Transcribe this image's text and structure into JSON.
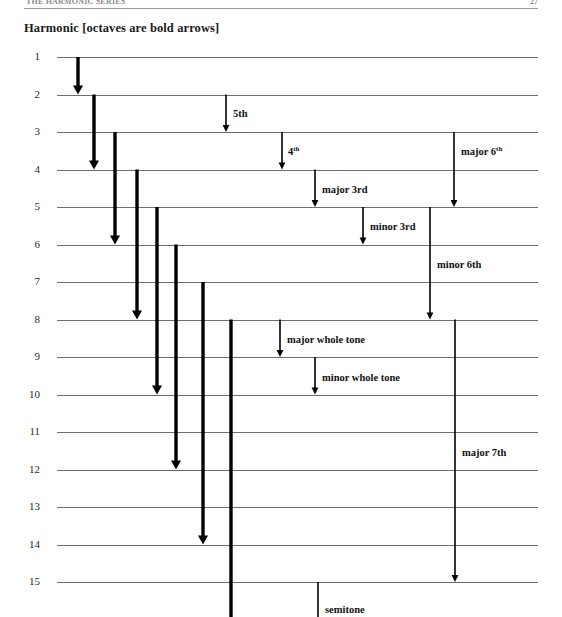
{
  "page": {
    "running_head": "THE HARMONIC SERIES",
    "folio": "27",
    "figure_title": "Harmonic  [octaves are bold arrows]"
  },
  "chart_data": {
    "type": "diagram",
    "title": "Harmonic  [octaves are bold arrows]",
    "xlabel": "",
    "ylabel": "Harmonic number",
    "grid": true,
    "legend": "octaves are bold arrows",
    "categories": [
      "1",
      "2",
      "3",
      "4",
      "5",
      "6",
      "7",
      "8",
      "9",
      "10",
      "11",
      "12",
      "13",
      "14",
      "15"
    ],
    "row_labels": [
      "1",
      "2",
      "3",
      "4",
      "5",
      "6",
      "7",
      "8",
      "9",
      "10",
      "11",
      "12",
      "13",
      "14",
      "15"
    ],
    "row_count": 15,
    "octave_arrows": [
      {
        "name": "octave-1-2",
        "from": 1,
        "to": 2,
        "x": 78,
        "bold": true
      },
      {
        "name": "octave-2-4",
        "from": 2,
        "to": 4,
        "x": 94,
        "bold": true
      },
      {
        "name": "octave-3-6",
        "from": 3,
        "to": 6,
        "x": 115,
        "bold": true
      },
      {
        "name": "octave-4-8",
        "from": 4,
        "to": 8,
        "x": 137,
        "bold": true
      },
      {
        "name": "octave-5-10",
        "from": 5,
        "to": 10,
        "x": 157,
        "bold": true
      },
      {
        "name": "octave-6-12",
        "from": 6,
        "to": 12,
        "x": 176,
        "bold": true
      },
      {
        "name": "octave-7-14",
        "from": 7,
        "to": 14,
        "x": 203,
        "bold": true
      },
      {
        "name": "octave-8-16",
        "from": 8,
        "to": 16,
        "x": 231,
        "bold": true
      }
    ],
    "interval_arrows": [
      {
        "name": "fifth",
        "label": "5th",
        "sup": "",
        "from": 2,
        "to": 3,
        "x": 226,
        "label_x": 233,
        "label_y": 108
      },
      {
        "name": "fourth",
        "label": "4",
        "sup": "th",
        "from": 3,
        "to": 4,
        "x": 282,
        "label_x": 288,
        "label_y": 146
      },
      {
        "name": "major-sixth",
        "label": "major 6",
        "sup": "th",
        "from": 3,
        "to": 5,
        "x": 454,
        "label_x": 461,
        "label_y": 146
      },
      {
        "name": "major-third",
        "label": "major 3rd",
        "sup": "",
        "from": 4,
        "to": 5,
        "x": 315,
        "label_x": 322,
        "label_y": 184
      },
      {
        "name": "minor-third",
        "label": "minor 3rd",
        "sup": "",
        "from": 5,
        "to": 6,
        "x": 363,
        "label_x": 370,
        "label_y": 221
      },
      {
        "name": "minor-sixth",
        "label": "minor 6th",
        "sup": "",
        "from": 5,
        "to": 8,
        "x": 430,
        "label_x": 437,
        "label_y": 259
      },
      {
        "name": "major-whole-tone",
        "label": "major whole tone",
        "sup": "",
        "from": 8,
        "to": 9,
        "x": 280,
        "label_x": 287,
        "label_y": 334
      },
      {
        "name": "minor-whole-tone",
        "label": "minor whole tone",
        "sup": "",
        "from": 9,
        "to": 10,
        "x": 315,
        "label_x": 322,
        "label_y": 372
      },
      {
        "name": "major-seventh",
        "label": "major 7th",
        "sup": "",
        "from": 8,
        "to": 15,
        "x": 455,
        "label_x": 462,
        "label_y": 447
      },
      {
        "name": "semitone",
        "label": "semitone",
        "sup": "",
        "from": 15,
        "to": 17,
        "x": 318,
        "label_x": 325,
        "label_y": 604
      }
    ],
    "colors": {
      "gridline": "#6e6e6e",
      "arrow": "#000000",
      "text": "#111111",
      "background": "#ffffff"
    }
  }
}
